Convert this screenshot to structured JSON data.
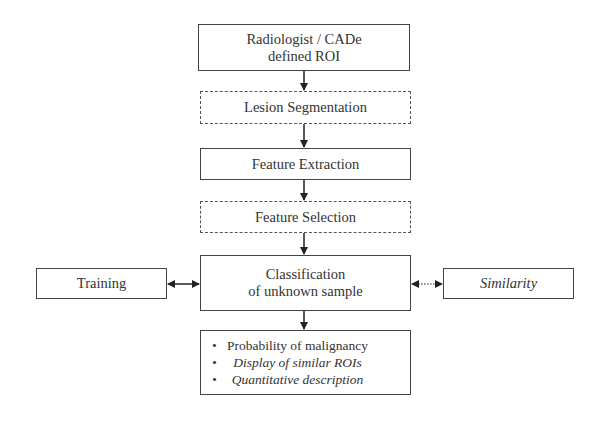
{
  "diagram": {
    "nodes": {
      "roi": {
        "line1": "Radiologist / CADe",
        "line2": "defined ROI",
        "style": "solid"
      },
      "segmentation": {
        "label": "Lesion Segmentation",
        "style": "dashed"
      },
      "extraction": {
        "label": "Feature Extraction",
        "style": "solid"
      },
      "selection": {
        "label": "Feature Selection",
        "style": "dashed"
      },
      "classification": {
        "line1": "Classification",
        "line2": "of unknown sample",
        "style": "solid"
      },
      "training": {
        "label": "Training",
        "style": "solid"
      },
      "similarity": {
        "label": "Similarity",
        "style": "solid",
        "italic": true
      },
      "output": {
        "items": [
          {
            "label": "Probability of malignancy",
            "italic": false
          },
          {
            "label": "Display of similar ROIs",
            "italic": true
          },
          {
            "label": "Quantitative description",
            "italic": true
          }
        ]
      }
    },
    "edges": [
      {
        "from": "roi",
        "to": "segmentation",
        "type": "arrow"
      },
      {
        "from": "segmentation",
        "to": "extraction",
        "type": "arrow"
      },
      {
        "from": "extraction",
        "to": "selection",
        "type": "arrow"
      },
      {
        "from": "selection",
        "to": "classification",
        "type": "arrow"
      },
      {
        "from": "classification",
        "to": "output",
        "type": "arrow"
      },
      {
        "from": "training",
        "to": "classification",
        "type": "bidirectional-solid"
      },
      {
        "from": "similarity",
        "to": "classification",
        "type": "bidirectional-dotted"
      }
    ]
  }
}
